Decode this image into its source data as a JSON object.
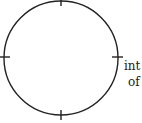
{
  "diagram": {
    "shape": "circle-with-ticks",
    "ticks": [
      "top",
      "left",
      "right",
      "bottom"
    ],
    "labels": {
      "line1": "int",
      "line2": "of"
    },
    "stroke_color": "#222222"
  }
}
